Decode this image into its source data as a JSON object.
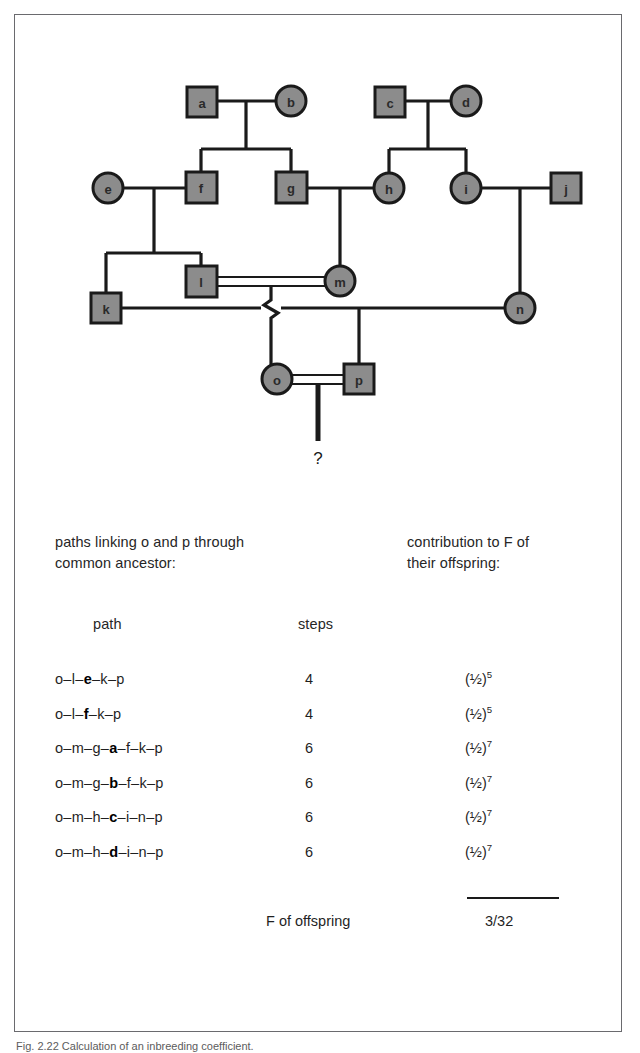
{
  "figure": {
    "caption": "Fig. 2.22   Calculation of an inbreeding coefficient.",
    "question_mark": "?"
  },
  "pedigree": {
    "symbol_fill": "#8c8c8c",
    "symbol_stroke": "#1a1a1a",
    "line_color": "#1a1a1a",
    "individuals": [
      {
        "id": "a",
        "label": "a",
        "sex": "male",
        "generation": 1,
        "x": 186,
        "y": 86
      },
      {
        "id": "b",
        "label": "b",
        "sex": "female",
        "generation": 1,
        "x": 276,
        "y": 86
      },
      {
        "id": "c",
        "label": "c",
        "sex": "male",
        "generation": 1,
        "x": 374,
        "y": 86
      },
      {
        "id": "d",
        "label": "d",
        "sex": "female",
        "generation": 1,
        "x": 451,
        "y": 86
      },
      {
        "id": "e",
        "label": "e",
        "sex": "female",
        "generation": 2,
        "x": 93,
        "y": 173
      },
      {
        "id": "f",
        "label": "f",
        "sex": "male",
        "generation": 2,
        "x": 186,
        "y": 173
      },
      {
        "id": "g",
        "label": "g",
        "sex": "male",
        "generation": 2,
        "x": 276,
        "y": 173
      },
      {
        "id": "h",
        "label": "h",
        "sex": "female",
        "generation": 2,
        "x": 374,
        "y": 173
      },
      {
        "id": "i",
        "label": "i",
        "sex": "female",
        "generation": 2,
        "x": 451,
        "y": 173
      },
      {
        "id": "j",
        "label": "j",
        "sex": "male",
        "generation": 2,
        "x": 551,
        "y": 173
      },
      {
        "id": "k",
        "label": "k",
        "sex": "male",
        "generation": 3,
        "x": 91,
        "y": 293
      },
      {
        "id": "l",
        "label": "l",
        "sex": "male",
        "generation": 3,
        "x": 186,
        "y": 266
      },
      {
        "id": "m",
        "label": "m",
        "sex": "female",
        "generation": 3,
        "x": 325,
        "y": 266
      },
      {
        "id": "n",
        "label": "n",
        "sex": "female",
        "generation": 3,
        "x": 505,
        "y": 293
      },
      {
        "id": "o",
        "label": "o",
        "sex": "female",
        "generation": 4,
        "x": 262,
        "y": 364
      },
      {
        "id": "p",
        "label": "p",
        "sex": "male",
        "generation": 4,
        "x": 344,
        "y": 364
      }
    ],
    "matings": [
      {
        "parents": [
          "a",
          "b"
        ],
        "children": [
          "f",
          "g"
        ],
        "consanguineous": false
      },
      {
        "parents": [
          "c",
          "d"
        ],
        "children": [
          "h",
          "i"
        ],
        "consanguineous": false
      },
      {
        "parents": [
          "e",
          "f"
        ],
        "children": [
          "k",
          "l"
        ],
        "consanguineous": false
      },
      {
        "parents": [
          "g",
          "h"
        ],
        "children": [
          "m"
        ],
        "consanguineous": false
      },
      {
        "parents": [
          "i",
          "j"
        ],
        "children": [
          "n"
        ],
        "consanguineous": false
      },
      {
        "parents": [
          "l",
          "m"
        ],
        "children": [
          "o"
        ],
        "consanguineous": true
      },
      {
        "parents": [
          "k",
          "n"
        ],
        "children": [
          "p"
        ],
        "consanguineous": false
      },
      {
        "parents": [
          "o",
          "p"
        ],
        "children": [
          "?"
        ],
        "consanguineous": true
      }
    ]
  },
  "table": {
    "header_left": "paths linking o and p through\ncommon ancestor:",
    "header_right": "contribution to F of\ntheir offspring:",
    "col_path": "path",
    "col_steps": "steps",
    "rows": [
      {
        "prefix": "o–l–",
        "ancestor": "e",
        "suffix": "–k–p",
        "steps": "4",
        "contrib_base": "(½)",
        "contrib_exp": "5"
      },
      {
        "prefix": "o–l–",
        "ancestor": "f",
        "suffix": "–k–p",
        "steps": "4",
        "contrib_base": "(½)",
        "contrib_exp": "5"
      },
      {
        "prefix": "o–m–g–",
        "ancestor": "a",
        "suffix": "–f–k–p",
        "steps": "6",
        "contrib_base": "(½)",
        "contrib_exp": "7"
      },
      {
        "prefix": "o–m–g–",
        "ancestor": "b",
        "suffix": "–f–k–p",
        "steps": "6",
        "contrib_base": "(½)",
        "contrib_exp": "7"
      },
      {
        "prefix": "o–m–h–",
        "ancestor": "c",
        "suffix": "–i–n–p",
        "steps": "6",
        "contrib_base": "(½)",
        "contrib_exp": "7"
      },
      {
        "prefix": "o–m–h–",
        "ancestor": "d",
        "suffix": "–i–n–p",
        "steps": "6",
        "contrib_base": "(½)",
        "contrib_exp": "7"
      }
    ],
    "summary_label": "F of offspring",
    "summary_value": "3/32"
  }
}
